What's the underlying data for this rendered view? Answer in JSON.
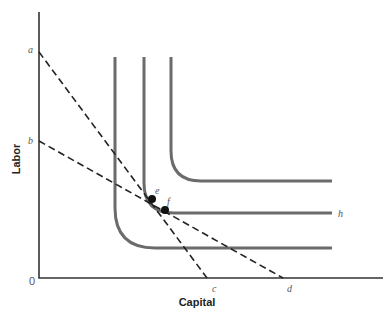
{
  "diagram": {
    "type": "isoquant-isocost diagram",
    "axes": {
      "x_label": "Capital",
      "y_label": "Labor",
      "origin_label": "0"
    },
    "intercept_labels": {
      "y_high": "a",
      "y_low": "b",
      "x_low": "c",
      "x_high": "d"
    },
    "isoquants": [
      {
        "name": "inner isoquant",
        "label": ""
      },
      {
        "name": "middle isoquant",
        "label": "h"
      },
      {
        "name": "outer isoquant",
        "label": ""
      }
    ],
    "isocost_lines": [
      {
        "from": "a",
        "to": "c",
        "style": "dashed"
      },
      {
        "from": "b",
        "to": "d",
        "style": "dashed"
      }
    ],
    "points": [
      {
        "label": "e"
      },
      {
        "label": "f"
      }
    ],
    "colors": {
      "axis": "#333333",
      "isoquant": "#6b6b6b",
      "isocost": "#222222",
      "point": "#111111"
    }
  }
}
